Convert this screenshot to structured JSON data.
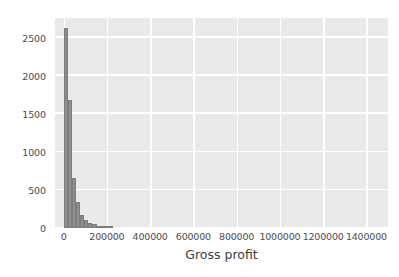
{
  "chart_data": {
    "type": "bar",
    "title": "",
    "subtitle": "",
    "xlabel": "Gross profit",
    "ylabel": "",
    "xlim": [
      -40000,
      1500000
    ],
    "ylim": [
      0,
      2760
    ],
    "grid": true,
    "legend": null,
    "xticks": [
      0,
      200000,
      400000,
      600000,
      800000,
      1000000,
      1200000,
      1400000
    ],
    "xtick_labels": [
      "0",
      "200000",
      "400000",
      "600000",
      "800000",
      "1000000",
      "1200000",
      "1400000"
    ],
    "yticks": [
      0,
      500,
      1000,
      1500,
      2000,
      2500
    ],
    "ytick_labels": [
      "0",
      "500",
      "1000",
      "1500",
      "2000",
      "2500"
    ],
    "bin_width": 19000,
    "bin_starts": [
      0,
      19000,
      38000,
      57000,
      76000,
      95000,
      114000,
      133000,
      152000,
      171000,
      190000,
      209000
    ],
    "values": [
      2630,
      1680,
      660,
      340,
      175,
      105,
      70,
      55,
      30,
      22,
      12,
      8
    ],
    "bar_color": "#8e8e8e",
    "background_color": "#eaeaea",
    "gridline_color": "#ffffff",
    "tick_label_color": "#4d4d4d"
  }
}
